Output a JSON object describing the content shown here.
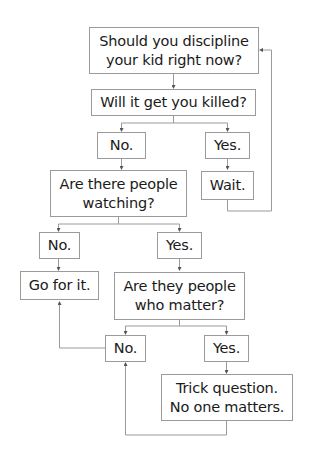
{
  "flowchart": {
    "colors": {
      "stroke": "#9a9a9a",
      "text": "#1a1a1a",
      "background": "#ffffff"
    },
    "nodes": {
      "q_discipline": "Should you discipline\nyour kid right now?",
      "q_killed": "Will it get you killed?",
      "a_killed_no": "No.",
      "a_killed_yes": "Yes.",
      "wait": "Wait.",
      "q_watching": "Are there people\nwatching?",
      "a_watching_no": "No.",
      "a_watching_yes": "Yes.",
      "go_for_it": "Go for it.",
      "q_matter": "Are they people\nwho matter?",
      "a_matter_no": "No.",
      "a_matter_yes": "Yes.",
      "trick": "Trick question.\nNo one matters."
    }
  }
}
